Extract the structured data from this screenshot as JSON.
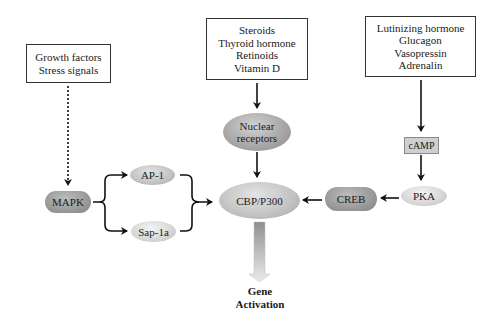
{
  "diagram": {
    "input_boxes": [
      {
        "id": "growth",
        "lines": [
          "Growth factors",
          "Stress signals"
        ]
      },
      {
        "id": "steroids",
        "lines": [
          "Steroids",
          "Thyroid hormone",
          "Retinoids",
          "Vitamin D"
        ]
      },
      {
        "id": "hormones",
        "lines": [
          "Lutinizing hormone",
          "Glucagon",
          "Vasopressin",
          "Adrenalin"
        ]
      }
    ],
    "nodes": {
      "nuclear_receptors": {
        "line1": "Nuclear",
        "line2": "receptors"
      },
      "camp": "cAMP",
      "mapk": "MAPK",
      "ap1": "AP-1",
      "sap1a": "Sap-1a",
      "cbp": "CBP/P300",
      "creb": "CREB",
      "pka": "PKA"
    },
    "output": {
      "line1": "Gene",
      "line2": "Activation"
    },
    "edges": [
      {
        "from": "Growth factors / Stress signals",
        "to": "MAPK",
        "style": "dotted"
      },
      {
        "from": "MAPK",
        "to": "AP-1",
        "style": "solid"
      },
      {
        "from": "MAPK",
        "to": "Sap-1a",
        "style": "solid"
      },
      {
        "from": "AP-1 + Sap-1a",
        "to": "CBP/P300",
        "style": "solid"
      },
      {
        "from": "Steroids / Thyroid hormone / Retinoids / Vitamin D",
        "to": "Nuclear receptors",
        "style": "solid"
      },
      {
        "from": "Nuclear receptors",
        "to": "CBP/P300",
        "style": "solid"
      },
      {
        "from": "Lutinizing hormone / Glucagon / Vasopressin / Adrenalin",
        "to": "cAMP",
        "style": "solid"
      },
      {
        "from": "cAMP",
        "to": "PKA",
        "style": "solid"
      },
      {
        "from": "PKA",
        "to": "CREB",
        "style": "solid"
      },
      {
        "from": "CREB",
        "to": "CBP/P300",
        "style": "solid"
      },
      {
        "from": "CBP/P300",
        "to": "Gene Activation",
        "style": "gradient-block"
      }
    ]
  }
}
